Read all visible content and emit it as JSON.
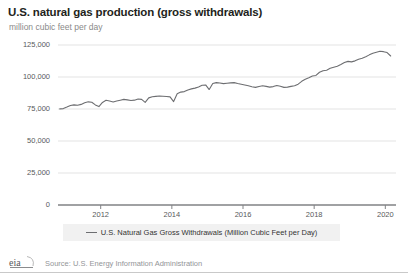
{
  "header": {
    "title": "U.S. natural gas production (gross withdrawals)",
    "subtitle": "million cubic feet per day"
  },
  "footer": {
    "logo_text": "eia",
    "source": "Source: U.S. Energy Information Administration"
  },
  "legend": {
    "items": [
      {
        "label": "U.S. Natural Gas Gross Withdrawals (Million Cubic Feet per Day)",
        "color": "#6d6e71"
      }
    ]
  },
  "chart_data": {
    "type": "line",
    "title": "U.S. natural gas production (gross withdrawals)",
    "subtitle": "million cubic feet per day",
    "xlabel": "",
    "ylabel": "million cubic feet per day",
    "xlim": [
      2010.8,
      2020.3
    ],
    "ylim": [
      0,
      125000
    ],
    "yticks": [
      0,
      25000,
      50000,
      75000,
      100000,
      125000
    ],
    "ytick_labels": [
      "0",
      "25,000",
      "50,000",
      "75,000",
      "100,000",
      "125,000"
    ],
    "xticks": [
      2012,
      2014,
      2016,
      2018,
      2020
    ],
    "xtick_labels": [
      "2012",
      "2014",
      "2016",
      "2018",
      "2020"
    ],
    "grid": "horizontal",
    "legend_position": "bottom",
    "line_color": "#6d6e71",
    "series": [
      {
        "name": "U.S. Natural Gas Gross Withdrawals (Million Cubic Feet per Day)",
        "x": [
          2010.85,
          2010.95,
          2011.05,
          2011.15,
          2011.25,
          2011.35,
          2011.45,
          2011.55,
          2011.65,
          2011.75,
          2011.85,
          2011.95,
          2012.05,
          2012.15,
          2012.25,
          2012.35,
          2012.45,
          2012.55,
          2012.65,
          2012.75,
          2012.85,
          2012.95,
          2013.05,
          2013.15,
          2013.25,
          2013.35,
          2013.45,
          2013.55,
          2013.65,
          2013.75,
          2013.85,
          2013.95,
          2014.05,
          2014.15,
          2014.25,
          2014.35,
          2014.45,
          2014.55,
          2014.65,
          2014.75,
          2014.85,
          2014.95,
          2015.05,
          2015.15,
          2015.25,
          2015.35,
          2015.45,
          2015.55,
          2015.65,
          2015.75,
          2015.85,
          2015.95,
          2016.05,
          2016.15,
          2016.25,
          2016.35,
          2016.45,
          2016.55,
          2016.65,
          2016.75,
          2016.85,
          2016.95,
          2017.05,
          2017.15,
          2017.25,
          2017.35,
          2017.45,
          2017.55,
          2017.65,
          2017.75,
          2017.85,
          2017.95,
          2018.05,
          2018.15,
          2018.25,
          2018.35,
          2018.45,
          2018.55,
          2018.65,
          2018.75,
          2018.85,
          2018.95,
          2019.05,
          2019.15,
          2019.25,
          2019.35,
          2019.45,
          2019.55,
          2019.65,
          2019.75,
          2019.85,
          2019.95,
          2020.05,
          2020.15
        ],
        "values": [
          75100,
          75300,
          76500,
          77800,
          78200,
          77900,
          78600,
          79900,
          80600,
          80300,
          78200,
          76900,
          80100,
          81800,
          81200,
          80500,
          81300,
          81900,
          82500,
          82100,
          81600,
          81900,
          82800,
          82500,
          80200,
          83700,
          84600,
          84900,
          85200,
          85000,
          84800,
          84500,
          80800,
          86900,
          88200,
          88600,
          89900,
          90700,
          91300,
          92200,
          93500,
          93800,
          90200,
          94900,
          95600,
          95300,
          94800,
          95100,
          95400,
          95600,
          94900,
          94300,
          93700,
          93100,
          92400,
          91900,
          92600,
          93100,
          92700,
          92100,
          92500,
          93400,
          92800,
          91900,
          92100,
          92700,
          93100,
          94400,
          96600,
          98200,
          99400,
          100800,
          101200,
          103700,
          104900,
          105300,
          106800,
          107600,
          108400,
          109800,
          111300,
          112200,
          111800,
          112600,
          113900,
          114700,
          115800,
          117300,
          118600,
          119400,
          120100,
          119800,
          119100,
          116400
        ]
      }
    ]
  }
}
